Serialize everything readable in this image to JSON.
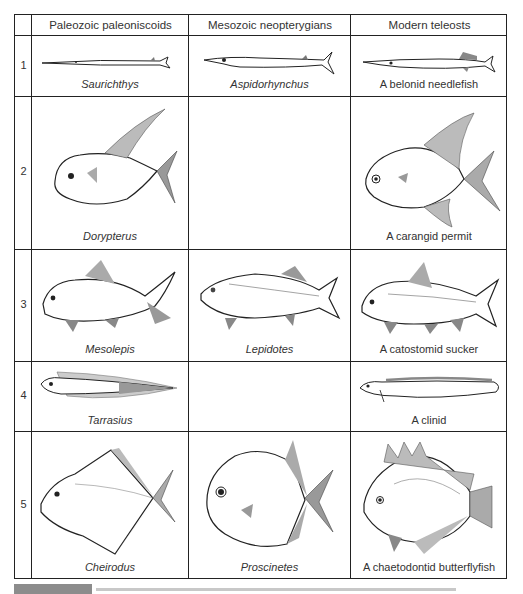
{
  "figure": {
    "columns": [
      {
        "label": "Paleozoic paleoniscoids"
      },
      {
        "label": "Mesozoic neopterygians"
      },
      {
        "label": "Modern teleosts"
      }
    ],
    "rows": [
      {
        "number": "1",
        "cells": [
          {
            "name": "Saurichthys",
            "italic": true,
            "shape": "needle"
          },
          {
            "name": "Aspidorhynchus",
            "italic": true,
            "shape": "needle"
          },
          {
            "name": "A belonid needlefish",
            "italic": false,
            "shape": "needle"
          }
        ]
      },
      {
        "number": "2",
        "cells": [
          {
            "name": "Dorypterus",
            "italic": true,
            "shape": "permit"
          },
          {
            "name": "",
            "italic": false,
            "shape": "empty"
          },
          {
            "name": "A carangid permit",
            "italic": false,
            "shape": "permit"
          }
        ]
      },
      {
        "number": "3",
        "cells": [
          {
            "name": "Mesolepis",
            "italic": true,
            "shape": "carp"
          },
          {
            "name": "Lepidotes",
            "italic": true,
            "shape": "carp"
          },
          {
            "name": "A catostomid sucker",
            "italic": false,
            "shape": "carp"
          }
        ]
      },
      {
        "number": "4",
        "cells": [
          {
            "name": "Tarrasius",
            "italic": true,
            "shape": "eel"
          },
          {
            "name": "",
            "italic": false,
            "shape": "empty"
          },
          {
            "name": "A clinid",
            "italic": false,
            "shape": "eel"
          }
        ]
      },
      {
        "number": "5",
        "cells": [
          {
            "name": "Cheirodus",
            "italic": true,
            "shape": "deep"
          },
          {
            "name": "Proscinetes",
            "italic": true,
            "shape": "deep"
          },
          {
            "name": "A chaetodontid butterflyfish",
            "italic": false,
            "shape": "deep"
          }
        ]
      }
    ],
    "caption": {
      "label_bar_color": "#8c8c8c",
      "text_truncated": true
    },
    "colors": {
      "line": "#222222",
      "text": "#333333",
      "background": "#ffffff"
    }
  }
}
